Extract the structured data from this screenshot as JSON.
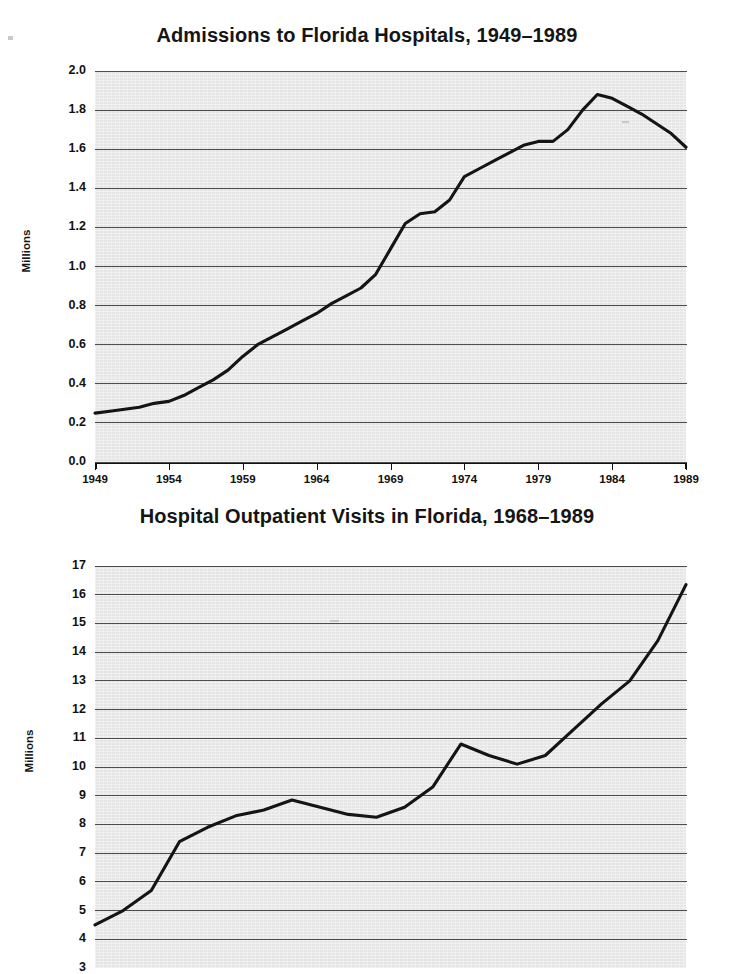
{
  "page": {
    "background": "#ffffff",
    "line_color": "#141414",
    "plot_background": "#ebebeb",
    "gridline_color": "#4d4d4d"
  },
  "charts": [
    {
      "id": "admissions-chart",
      "title": "Admissions to Florida Hospitals, 1949–1989",
      "ylabel": "Millions",
      "ytick_labels": [
        "2.0",
        "1.8",
        "1.6",
        "1.4",
        "1.2",
        "1.0",
        "0.8",
        "0.6",
        "0.4",
        "0.2",
        "0.0"
      ],
      "xtick_labels": [
        "1949",
        "1954",
        "1959",
        "1964",
        "1969",
        "1974",
        "1979",
        "1984",
        "1989"
      ]
    },
    {
      "id": "outpatient-chart",
      "title": "Hospital Outpatient Visits in Florida, 1968–1989",
      "ylabel": "Millions",
      "ytick_labels": [
        "17",
        "16",
        "15",
        "14",
        "13",
        "12",
        "11",
        "10",
        "9",
        "8",
        "7",
        "6",
        "5",
        "4",
        "3"
      ],
      "xtick_labels": []
    }
  ],
  "chart_data": [
    {
      "type": "line",
      "title": "Admissions to Florida Hospitals, 1949–1989",
      "xlabel": "",
      "ylabel": "Millions",
      "xlim": [
        1949,
        1989
      ],
      "ylim": [
        0.0,
        2.0
      ],
      "ytick_values": [
        0.0,
        0.2,
        0.4,
        0.6,
        0.8,
        1.0,
        1.2,
        1.4,
        1.6,
        1.8,
        2.0
      ],
      "xtick_values": [
        1949,
        1954,
        1959,
        1964,
        1969,
        1974,
        1979,
        1984,
        1989
      ],
      "grid": "horizontal",
      "legend": "none",
      "x": [
        1949,
        1950,
        1951,
        1952,
        1953,
        1954,
        1955,
        1956,
        1957,
        1958,
        1959,
        1960,
        1961,
        1962,
        1963,
        1964,
        1965,
        1966,
        1967,
        1968,
        1969,
        1970,
        1971,
        1972,
        1973,
        1974,
        1975,
        1976,
        1977,
        1978,
        1979,
        1980,
        1981,
        1982,
        1983,
        1984,
        1985,
        1986,
        1987,
        1988,
        1989
      ],
      "y": [
        0.25,
        0.26,
        0.27,
        0.28,
        0.3,
        0.31,
        0.34,
        0.38,
        0.42,
        0.47,
        0.54,
        0.6,
        0.64,
        0.68,
        0.72,
        0.76,
        0.81,
        0.85,
        0.89,
        0.96,
        1.09,
        1.22,
        1.27,
        1.28,
        1.34,
        1.46,
        1.5,
        1.54,
        1.58,
        1.62,
        1.64,
        1.64,
        1.7,
        1.8,
        1.88,
        1.86,
        1.82,
        1.78,
        1.73,
        1.68,
        1.61
      ]
    },
    {
      "type": "line",
      "title": "Hospital Outpatient Visits in Florida, 1968–1989",
      "xlabel": "",
      "ylabel": "Millions",
      "xlim": [
        1968,
        1989
      ],
      "ylim": [
        3,
        17
      ],
      "ytick_values": [
        3,
        4,
        5,
        6,
        7,
        8,
        9,
        10,
        11,
        12,
        13,
        14,
        15,
        16,
        17
      ],
      "grid": "horizontal",
      "legend": "none",
      "note": "bottom of figure is cropped below the 4 gridline; the 3 tick label is partially visible",
      "x": [
        1968,
        1969,
        1970,
        1971,
        1972,
        1973,
        1974,
        1975,
        1976,
        1977,
        1978,
        1979,
        1980,
        1981,
        1982,
        1983,
        1984,
        1985,
        1986,
        1987,
        1988,
        1989
      ],
      "y": [
        4.5,
        5.0,
        5.7,
        7.4,
        7.9,
        8.3,
        8.5,
        8.85,
        8.6,
        8.35,
        8.25,
        8.6,
        9.3,
        10.8,
        10.4,
        10.1,
        10.4,
        11.3,
        12.2,
        13.0,
        14.4,
        16.35
      ]
    }
  ]
}
